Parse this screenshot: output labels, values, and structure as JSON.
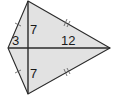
{
  "figure": {
    "shape": "kite",
    "fill_color": "#e2e2e2",
    "stroke_color": "#2a2a2a",
    "vertices": {
      "top": [
        28,
        1
      ],
      "bottom": [
        28,
        94
      ],
      "left": [
        8,
        48
      ],
      "right": [
        110,
        48
      ]
    },
    "diagonals": {
      "horizontal": {
        "from": "left",
        "to": "right"
      },
      "vertical": {
        "from": "top",
        "to": "bottom"
      }
    },
    "labels": {
      "upper_half_vertical": "7",
      "lower_half_vertical": "7",
      "left_segment": "3",
      "right_segment": "12"
    },
    "congruence_marks": {
      "left_edges": "single-tick",
      "right_edges": "double-tick"
    }
  }
}
